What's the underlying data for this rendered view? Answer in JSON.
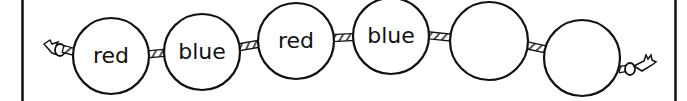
{
  "diagram": {
    "type": "bead-pattern-string",
    "colors": {
      "stroke": "#111111",
      "background": "#ffffff"
    },
    "beads": [
      {
        "label": "red",
        "cx": 111,
        "cy": 56,
        "r": 38
      },
      {
        "label": "blue",
        "cx": 202,
        "cy": 52,
        "r": 38
      },
      {
        "label": "red",
        "cx": 296,
        "cy": 41,
        "r": 38
      },
      {
        "label": "blue",
        "cx": 391,
        "cy": 36,
        "r": 38
      },
      {
        "label": "",
        "cx": 489,
        "cy": 41,
        "r": 39
      },
      {
        "label": "",
        "cx": 582,
        "cy": 58,
        "r": 38
      }
    ],
    "left_end": "rope-knot",
    "right_end": "rope-knot"
  }
}
